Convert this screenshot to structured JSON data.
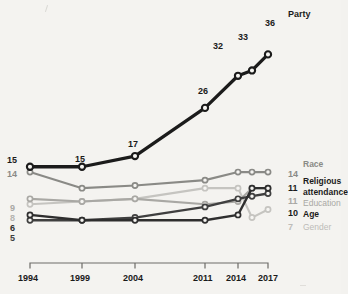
{
  "chart_data": {
    "type": "line",
    "title": "",
    "subtitle": "",
    "xlabel": "",
    "ylabel": "",
    "x": [
      "1994",
      "1999",
      "2004",
      "2011",
      "2014",
      "2015",
      "2017"
    ],
    "categories": [
      "1994",
      "1999",
      "2004",
      "2011",
      "2014",
      "2015",
      "2017"
    ],
    "xticklabels": [
      "1994",
      "1999",
      "2004",
      "2011",
      "2014",
      "2017"
    ],
    "ylim": [
      0,
      40
    ],
    "grid": false,
    "legend_position": "right",
    "series": [
      {
        "name": "Party",
        "color": "#1b1b1b",
        "values": [
          15,
          15,
          17,
          26,
          32,
          33,
          36
        ],
        "point_labels": [
          "15",
          "15",
          "17",
          "26",
          "32",
          "33",
          "36"
        ],
        "start_label": "15",
        "end_label": "36",
        "end_name": "Party"
      },
      {
        "name": "Race",
        "color": "#8a8a86",
        "values": [
          14,
          11,
          11.5,
          12.5,
          14,
          14,
          14
        ],
        "start_label": "14",
        "end_label": "14",
        "end_name": "Race"
      },
      {
        "name": "Religious attendance",
        "color": "#2e2e2e",
        "values": [
          6,
          5,
          5,
          5,
          6,
          11,
          11
        ],
        "start_label": "6",
        "end_label": "11",
        "end_name": "Religious attendance"
      },
      {
        "name": "Education",
        "color": "#a9a8a4",
        "values": [
          9,
          8.5,
          9,
          8,
          8.5,
          11,
          11
        ],
        "start_label": "9",
        "end_label": "11",
        "end_name": "Education"
      },
      {
        "name": "Age",
        "color": "#3f3f3f",
        "values": [
          5,
          5,
          5.5,
          7.5,
          9,
          9.5,
          10
        ],
        "start_label": "5",
        "end_label": "10",
        "end_name": "Age"
      },
      {
        "name": "Gender",
        "color": "#c5c4c0",
        "values": [
          8,
          8.5,
          9,
          11,
          11,
          5.5,
          7
        ],
        "start_label": "8",
        "end_label": "7",
        "end_name": "Gender"
      }
    ]
  },
  "axis": {
    "ticks": [
      {
        "label": "1994"
      },
      {
        "label": "1999"
      },
      {
        "label": "2004"
      },
      {
        "label": "2011"
      },
      {
        "label": "2014"
      },
      {
        "label": "2017"
      }
    ]
  },
  "left_labels": [
    {
      "text": "15",
      "series": "Party"
    },
    {
      "text": "14",
      "series": "Race"
    },
    {
      "text": "9",
      "series": "Education"
    },
    {
      "text": "8",
      "series": "Gender"
    },
    {
      "text": "6",
      "series": "Religious attendance"
    },
    {
      "text": "5",
      "series": "Age"
    }
  ],
  "right_labels": [
    {
      "value": "14",
      "name": "Race"
    },
    {
      "value": "11",
      "name": "Religious"
    },
    {
      "value": "",
      "name": "attendance"
    },
    {
      "value": "11",
      "name": "Education"
    },
    {
      "value": "10",
      "name": "Age"
    },
    {
      "value": "7",
      "name": "Gender"
    }
  ],
  "party_point_labels": [
    {
      "text": "15"
    },
    {
      "text": "15"
    },
    {
      "text": "17"
    },
    {
      "text": "26"
    },
    {
      "text": "32"
    },
    {
      "text": "33"
    },
    {
      "text": "36"
    }
  ],
  "party_title": "Party",
  "colors": {
    "party": "#1b1b1b",
    "race": "#8a8a86",
    "religious": "#2e2e2e",
    "education": "#a9a8a4",
    "age": "#3f3f3f",
    "gender": "#c5c4c0",
    "axis": "#6d6c68",
    "background": "#f4f3f0"
  }
}
